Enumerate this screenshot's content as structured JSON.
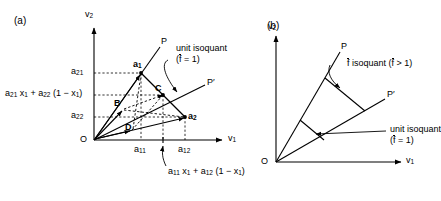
{
  "figure": {
    "type": "diagram",
    "background": "#ffffff",
    "stroke": "#000000",
    "width": 435,
    "height": 201
  },
  "panels": [
    {
      "id": "a",
      "tag": "(a)",
      "axes": {
        "x_label": "v",
        "x_label_sub": "1",
        "y_label": "v",
        "y_label_sub": "2",
        "origin_label": "O"
      },
      "rays": [
        {
          "name": "P",
          "label": "P"
        },
        {
          "name": "P-prime",
          "label": "P′"
        }
      ],
      "points": [
        {
          "name": "a1",
          "label": "a",
          "sub": "1"
        },
        {
          "name": "a2",
          "label": "a",
          "sub": "2"
        },
        {
          "name": "B",
          "label": "B"
        },
        {
          "name": "C",
          "label": "C"
        },
        {
          "name": "D",
          "label": "D"
        }
      ],
      "y_ticks": [
        {
          "name": "a21",
          "label": "a",
          "sub": "21"
        },
        {
          "name": "a21x1-plus-a22",
          "label": "a",
          "sub": "21",
          "tail": " x",
          "tail_sub": "1",
          "tail2": " + a",
          "tail2_sub": "22",
          "tail3": " (1 − x",
          "tail3_sub": "1",
          "tail4": ")"
        },
        {
          "name": "a22",
          "label": "a",
          "sub": "22"
        }
      ],
      "x_ticks": [
        {
          "name": "a11",
          "label": "a",
          "sub": "11"
        },
        {
          "name": "a12",
          "label": "a",
          "sub": "12"
        },
        {
          "name": "a11x1-plus-a12",
          "label": "a",
          "sub": "11",
          "tail": " x",
          "tail_sub": "1",
          "tail2": " + a",
          "tail2_sub": "12",
          "tail3": " (1 − x",
          "tail3_sub": "1",
          "tail4": ")"
        }
      ],
      "annotations": [
        {
          "name": "unit-isoquant",
          "line1": "unit isoquant",
          "line2_pre": "(",
          "line2_var": "f",
          "line2_post": " = 1)"
        }
      ]
    },
    {
      "id": "b",
      "tag": "(b)",
      "axes": {
        "x_label": "v",
        "x_label_sub": "1",
        "y_label": "v",
        "y_label_sub": "2",
        "origin_label": "O"
      },
      "rays": [
        {
          "name": "P",
          "label": "P"
        },
        {
          "name": "P-prime",
          "label": "P′"
        }
      ],
      "annotations": [
        {
          "name": "fbar-isoquant",
          "pre": "",
          "var": "f",
          "mid": " isoquant (",
          "var2": "f",
          "post": " > 1)"
        },
        {
          "name": "unit-isoquant",
          "line1": "unit isoquant",
          "line2_pre": "(",
          "line2_var": "f",
          "line2_post": " = 1)"
        }
      ]
    }
  ]
}
